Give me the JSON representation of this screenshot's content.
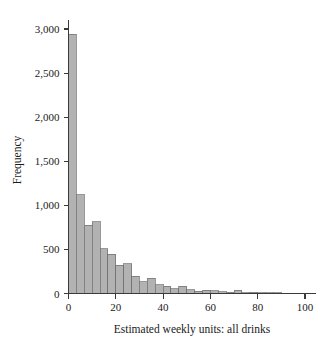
{
  "chart_data": {
    "type": "bar",
    "title": "",
    "subtitle": "",
    "xlabel": "Estimated weekly units: all drinks",
    "ylabel": "Frequency",
    "xlim": [
      -2,
      106
    ],
    "ylim": [
      0,
      3100
    ],
    "grid": false,
    "legend": null,
    "bin_width": 3.33,
    "xticks": [
      0,
      20,
      40,
      60,
      80,
      100
    ],
    "xticklabels": [
      "0",
      "20",
      "40",
      "60",
      "80",
      "100"
    ],
    "yticks": [
      0,
      500,
      1000,
      1500,
      2000,
      2500,
      3000
    ],
    "yticklabels": [
      "0",
      "500",
      "1,000",
      "1,500",
      "2,000",
      "2,500",
      "3,000"
    ],
    "bin_starts": [
      0,
      3.33,
      6.67,
      10,
      13.33,
      16.67,
      20,
      23.33,
      26.67,
      30,
      33.33,
      36.67,
      40,
      43.33,
      46.67,
      50,
      53.33,
      56.67,
      60,
      63.33,
      66.67,
      70,
      73.33,
      76.67,
      80,
      83.33,
      86.67,
      90,
      93.33,
      96.67,
      100
    ],
    "values": [
      2940,
      1120,
      775,
      815,
      510,
      445,
      320,
      340,
      195,
      135,
      175,
      100,
      85,
      55,
      80,
      45,
      25,
      35,
      30,
      20,
      15,
      35,
      10,
      12,
      8,
      10,
      6,
      5,
      4,
      3,
      2
    ],
    "bar_color": "#b2b2b2",
    "bar_edge_color": "#6e6e6e",
    "axis_color": "#3a3a3a",
    "background_color": "#ffffff"
  },
  "figure": {
    "name": "histogram-estimated-weekly-units"
  }
}
